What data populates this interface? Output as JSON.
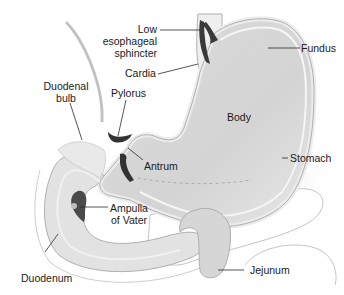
{
  "diagram": {
    "colors": {
      "background": "#ffffff",
      "organ_fill": "#d9d9d9",
      "organ_light": "#e8e8e8",
      "organ_wall": "#f2f2f2",
      "outline": "#a8a8a8",
      "sphincter": "#3a3a3a",
      "leader_line": "#2a2a2a",
      "text": "#1a1a1a"
    },
    "labels": {
      "low_esophageal_sphincter": {
        "line1": "Low",
        "line2": "esophageal",
        "line3": "sphincter"
      },
      "cardia": "Cardia",
      "fundus": "Fundus",
      "duodenal_bulb": {
        "line1": "Duodenal",
        "line2": "bulb"
      },
      "pylorus": "Pylorus",
      "body": "Body",
      "antrum": "Antrum",
      "stomach": "Stomach",
      "ampulla_of_vater": {
        "line1": "Ampulla",
        "line2": "of Vater"
      },
      "duodenum": "Duodenum",
      "jejunum": "Jejunum"
    }
  }
}
